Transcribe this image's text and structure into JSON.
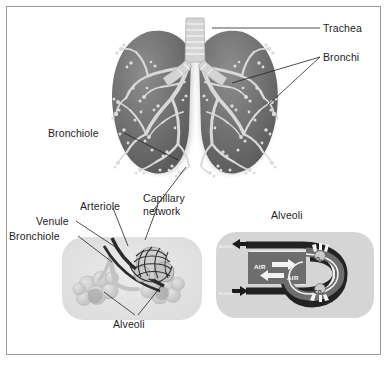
{
  "figure": {
    "background_color": "#ffffff",
    "border_color": "#9a9a9a"
  },
  "palette": {
    "lung_fill": "#6f6f6f",
    "lung_fill_light": "#8a8a8a",
    "lung_shadow": "#c9c9c9",
    "airway_fill": "#d8d8d8",
    "tree_fill": "#d9d9d9",
    "inset_bg": "#e3e3e3",
    "alveoli_fill": "#d2d2d2",
    "alveoli_dark": "#a8a8a8",
    "vessel_dark": "#2b2b2b",
    "label_text": "#1d1d1d",
    "leader_line": "#222222",
    "air_channel": "#6d6d6d",
    "arrow_white": "#f4f4f4"
  },
  "labels": {
    "trachea": "Trachea",
    "bronchi": "Bronchi",
    "bronchiole_upper": "Bronchiole",
    "arteriole": "Arteriole",
    "venule": "Venule",
    "bronchiole_lower": "Bronchiole",
    "capillary_network_line1": "Capillary",
    "capillary_network_line2": "network",
    "alveoli_lower": "Alveoli",
    "alveoli_inset_title": "Alveoli"
  },
  "gas_exchange": {
    "blood_in_label": "BLOOD",
    "blood_out_label": "BLOOD",
    "air_in_label": "AIR",
    "air_out_label": "AIR",
    "oxygen_label": "O₂",
    "carbon_dioxide_label": "CO₂",
    "air_in_direction": "right",
    "air_out_direction": "left",
    "blood_top_direction": "left",
    "blood_bottom_direction": "right",
    "oxygen_direction": "into-blood",
    "co2_direction": "out-of-blood"
  }
}
